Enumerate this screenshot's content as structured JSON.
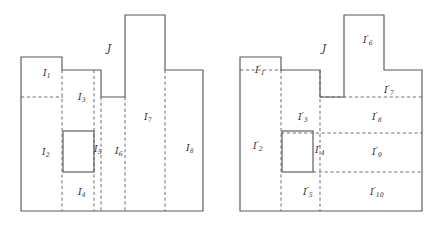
{
  "figure": {
    "background_color": "#ffffff",
    "solid_stroke_color": "#58585a",
    "dashed_stroke_color": "#6e6e70",
    "label_color": "#2f2f31",
    "canvas": {
      "width": 441,
      "height": 231
    }
  },
  "left_figure": {
    "name": "left-partition",
    "outer_label": {
      "text": "J",
      "x": 107,
      "y": 52
    },
    "labels": [
      {
        "id": "I1",
        "base": "I",
        "sub": "1",
        "prime": false,
        "x": 43,
        "y": 73
      },
      {
        "id": "I2",
        "base": "I",
        "sub": "2",
        "prime": false,
        "x": 42,
        "y": 152
      },
      {
        "id": "I3",
        "base": "I",
        "sub": "3",
        "prime": false,
        "x": 78,
        "y": 97
      },
      {
        "id": "I4",
        "base": "I",
        "sub": "4",
        "prime": false,
        "x": 78,
        "y": 192
      },
      {
        "id": "I5",
        "base": "I",
        "sub": "5",
        "prime": false,
        "x": 94,
        "y": 149
      },
      {
        "id": "I6",
        "base": "I",
        "sub": "6",
        "prime": false,
        "x": 115,
        "y": 151
      },
      {
        "id": "I7",
        "base": "I",
        "sub": "7",
        "prime": false,
        "x": 144,
        "y": 117
      },
      {
        "id": "I8",
        "base": "I",
        "sub": "8",
        "prime": false,
        "x": 186,
        "y": 148
      }
    ],
    "outline_path": "M 21 57 L 62 57 L 62 70 L 101 70 L 101 97 L 125 97 L 125 15 L 165 15 L 165 70 L 203 70 L 203 211 L 21 211 Z",
    "inner_rect": {
      "x": 63,
      "y": 131,
      "width": 31,
      "height": 41
    },
    "dashed_vertical_lines": [
      {
        "x": 62,
        "y1": 70,
        "y2": 211
      },
      {
        "x": 94,
        "y1": 70,
        "y2": 211
      },
      {
        "x": 101,
        "y1": 97,
        "y2": 211
      },
      {
        "x": 125,
        "y1": 97,
        "y2": 211
      },
      {
        "x": 165,
        "y1": 70,
        "y2": 211
      }
    ],
    "dashed_horizontal_lines": [
      {
        "y": 97,
        "x1": 21,
        "x2": 62
      }
    ]
  },
  "right_figure": {
    "name": "right-partition",
    "outer_label": {
      "text": "J",
      "x": 322,
      "y": 52
    },
    "labels": [
      {
        "id": "I1p",
        "base": "I",
        "sub": "1",
        "prime": true,
        "x": 255,
        "y": 70
      },
      {
        "id": "I2p",
        "base": "I",
        "sub": "2",
        "prime": true,
        "x": 253,
        "y": 146
      },
      {
        "id": "I3p",
        "base": "I",
        "sub": "3",
        "prime": true,
        "x": 298,
        "y": 117
      },
      {
        "id": "I4p",
        "base": "I",
        "sub": "4",
        "prime": true,
        "x": 315,
        "y": 150
      },
      {
        "id": "I5p",
        "base": "I",
        "sub": "5",
        "prime": true,
        "x": 303,
        "y": 192
      },
      {
        "id": "I6p",
        "base": "I",
        "sub": "6",
        "prime": true,
        "x": 363,
        "y": 40
      },
      {
        "id": "I7p",
        "base": "I",
        "sub": "7",
        "prime": true,
        "x": 384,
        "y": 90
      },
      {
        "id": "I8p",
        "base": "I",
        "sub": "8",
        "prime": true,
        "x": 372,
        "y": 117
      },
      {
        "id": "I9p",
        "base": "I",
        "sub": "9",
        "prime": true,
        "x": 372,
        "y": 152
      },
      {
        "id": "I10p",
        "base": "I",
        "sub": "10",
        "prime": true,
        "x": 372,
        "y": 192
      }
    ],
    "outline_path": "M 240 57 L 281 57 L 281 70 L 320 70 L 320 97 L 344 97 L 344 15 L 384 15 L 384 70 L 422 70 L 422 211 L 240 211 Z",
    "inner_rect": {
      "x": 282,
      "y": 131,
      "width": 31,
      "height": 41
    },
    "dashed_vertical_lines": [
      {
        "x": 281,
        "y1": 70,
        "y2": 211
      },
      {
        "x": 320,
        "y1": 70,
        "y2": 211
      }
    ],
    "dashed_horizontal_lines": [
      {
        "y": 70,
        "x1": 240,
        "x2": 281
      },
      {
        "y": 97,
        "x1": 320,
        "x2": 422
      },
      {
        "y": 133,
        "x1": 281,
        "x2": 422
      },
      {
        "y": 172,
        "x1": 313,
        "x2": 422
      }
    ]
  }
}
